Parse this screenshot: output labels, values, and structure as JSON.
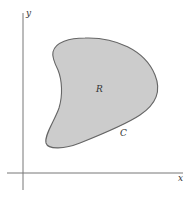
{
  "diagram": {
    "type": "region-with-boundary-curve",
    "axes": {
      "x_label": "x",
      "y_label": "y"
    },
    "region": {
      "label": "R",
      "fill_color": "#cccccc",
      "stroke_color": "#666666"
    },
    "curve": {
      "label": "C"
    },
    "colors": {
      "axis": "#777777",
      "background": "#ffffff"
    }
  }
}
